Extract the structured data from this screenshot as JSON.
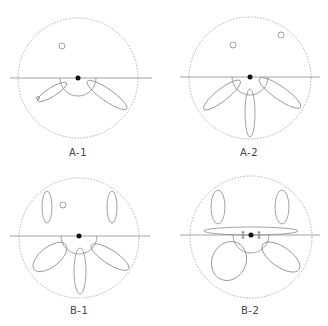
{
  "panels": [
    {
      "id": "A-1",
      "label": "A-1"
    },
    {
      "id": "A-2",
      "label": "A-2"
    },
    {
      "id": "B-1",
      "label": "B-1"
    },
    {
      "id": "B-2",
      "label": "B-2"
    }
  ],
  "colors": {
    "stroke": "#8a8a8a",
    "dashed_circle": "#999999",
    "center_dot": "#111111",
    "text": "#444444"
  },
  "caption": ""
}
